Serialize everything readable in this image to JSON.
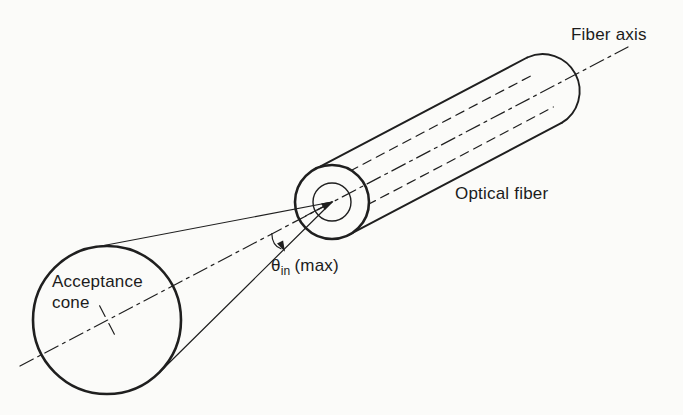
{
  "figure": {
    "type": "diagram",
    "background_color": "#fbfbf9",
    "ink_color": "#1f1f1f",
    "labels": {
      "fiber_axis": "Fiber axis",
      "optical_fiber": "Optical fiber",
      "acceptance_line1": "Acceptance",
      "acceptance_line2": "cone",
      "angle": {
        "theta": "θ",
        "sub": "in",
        "max": "(max)"
      }
    }
  }
}
